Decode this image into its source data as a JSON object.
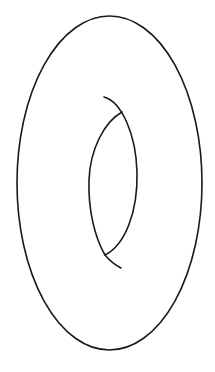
{
  "diagram": {
    "stroke_color": "#1a1a1a",
    "background_color": "#ffffff",
    "outer_ellipse": {
      "cx": 109.5,
      "cy": 183,
      "rx": 92.5,
      "ry": 167
    },
    "inner_hole": {
      "left_arc": "M122 112 C 104 122, 90 150, 89 180 C 88 210, 95 238, 105 255",
      "right_arc": "M104 97 C 122 102, 136 135, 137 172 C 138 212, 125 245, 105 255 C 110 261, 115 265, 121 268"
    }
  }
}
